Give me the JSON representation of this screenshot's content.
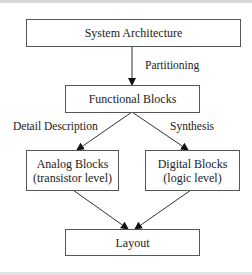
{
  "diagram": {
    "nodes": {
      "system_architecture": {
        "label": "System Architecture"
      },
      "functional_blocks": {
        "label": "Functional Blocks"
      },
      "analog_blocks": {
        "line1": "Analog Blocks",
        "line2": "(transistor level)"
      },
      "digital_blocks": {
        "line1": "Digital Blocks",
        "line2": "(logic level)"
      },
      "layout": {
        "label": "Layout"
      }
    },
    "edges": {
      "partitioning": {
        "label": "Partitioning",
        "from": "System Architecture",
        "to": "Functional Blocks"
      },
      "detail_description": {
        "label": "Detail Description",
        "from": "Functional Blocks",
        "to": "Analog Blocks"
      },
      "synthesis": {
        "label": "Synthesis",
        "from": "Functional Blocks",
        "to": "Digital Blocks"
      },
      "analog_to_layout": {
        "from": "Analog Blocks",
        "to": "Layout"
      },
      "digital_to_layout": {
        "from": "Digital Blocks",
        "to": "Layout"
      }
    }
  }
}
